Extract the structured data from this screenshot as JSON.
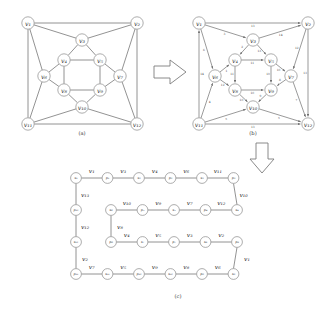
{
  "figure": {
    "panels": [
      {
        "id": "a",
        "caption": "(a)"
      },
      {
        "id": "b",
        "caption": "(b)"
      },
      {
        "id": "c",
        "caption": "(c)"
      }
    ],
    "arrows": [
      {
        "name": "arrow-right",
        "direction": "right"
      },
      {
        "name": "arrow-down",
        "direction": "down"
      }
    ]
  },
  "chart_data": {
    "type": "diagram",
    "title": "",
    "panel_a": {
      "caption": "(a)",
      "description": "undirected graph",
      "nodes": [
        {
          "id": "v1",
          "label": "v₁",
          "x": 28,
          "y": 23
        },
        {
          "id": "v2",
          "label": "v₂",
          "x": 137,
          "y": 23
        },
        {
          "id": "v3",
          "label": "v₃",
          "x": 82,
          "y": 40
        },
        {
          "id": "v4",
          "label": "v₄",
          "x": 64,
          "y": 60
        },
        {
          "id": "v5",
          "label": "v₅",
          "x": 100,
          "y": 60
        },
        {
          "id": "v6",
          "label": "v₆",
          "x": 44,
          "y": 76
        },
        {
          "id": "v7",
          "label": "v₇",
          "x": 120,
          "y": 76
        },
        {
          "id": "v8",
          "label": "v₈",
          "x": 64,
          "y": 90
        },
        {
          "id": "v9",
          "label": "v₉",
          "x": 100,
          "y": 90
        },
        {
          "id": "v10",
          "label": "v₁₀",
          "x": 82,
          "y": 107
        },
        {
          "id": "v11",
          "label": "v₁₁",
          "x": 28,
          "y": 124
        },
        {
          "id": "v12",
          "label": "v₁₂",
          "x": 137,
          "y": 124
        }
      ],
      "edges": [
        [
          "v1",
          "v2"
        ],
        [
          "v1",
          "v3"
        ],
        [
          "v1",
          "v6"
        ],
        [
          "v1",
          "v11"
        ],
        [
          "v2",
          "v3"
        ],
        [
          "v2",
          "v7"
        ],
        [
          "v2",
          "v12"
        ],
        [
          "v3",
          "v4"
        ],
        [
          "v3",
          "v5"
        ],
        [
          "v4",
          "v5"
        ],
        [
          "v4",
          "v6"
        ],
        [
          "v4",
          "v8"
        ],
        [
          "v5",
          "v7"
        ],
        [
          "v5",
          "v9"
        ],
        [
          "v6",
          "v8"
        ],
        [
          "v6",
          "v11"
        ],
        [
          "v7",
          "v9"
        ],
        [
          "v7",
          "v12"
        ],
        [
          "v8",
          "v9"
        ],
        [
          "v8",
          "v10"
        ],
        [
          "v9",
          "v10"
        ],
        [
          "v10",
          "v11"
        ],
        [
          "v10",
          "v12"
        ],
        [
          "v11",
          "v12"
        ]
      ]
    },
    "panel_b": {
      "caption": "(b)",
      "description": "directed graph with numbered edges",
      "nodes": [
        {
          "id": "v1",
          "label": "v₁",
          "x": 199,
          "y": 23
        },
        {
          "id": "v2",
          "label": "v₂",
          "x": 308,
          "y": 23
        },
        {
          "id": "v3",
          "label": "v₃",
          "x": 253,
          "y": 40
        },
        {
          "id": "v4",
          "label": "v₄",
          "x": 235,
          "y": 60
        },
        {
          "id": "v5",
          "label": "v₅",
          "x": 271,
          "y": 60
        },
        {
          "id": "v6",
          "label": "v₆",
          "x": 215,
          "y": 76
        },
        {
          "id": "v7",
          "label": "v₇",
          "x": 291,
          "y": 76
        },
        {
          "id": "v8",
          "label": "v₈",
          "x": 235,
          "y": 90
        },
        {
          "id": "v9",
          "label": "v₉",
          "x": 271,
          "y": 90
        },
        {
          "id": "v10",
          "label": "v₁₀",
          "x": 253,
          "y": 107
        },
        {
          "id": "v11",
          "label": "v₁₁",
          "x": 199,
          "y": 124
        },
        {
          "id": "v12",
          "label": "v₁₂",
          "x": 308,
          "y": 124
        }
      ],
      "edges": [
        {
          "from": "v1",
          "to": "v2",
          "weight": "13"
        },
        {
          "from": "v1",
          "to": "v3",
          "weight": "3"
        },
        {
          "from": "v1",
          "to": "v6",
          "weight": "6"
        },
        {
          "from": "v11",
          "to": "v1",
          "weight": "14"
        },
        {
          "from": "v3",
          "to": "v2",
          "weight": "14"
        },
        {
          "from": "v2",
          "to": "v7",
          "weight": "12"
        },
        {
          "from": "v2",
          "to": "v12",
          "weight": "13"
        },
        {
          "from": "v3",
          "to": "v4",
          "weight": "2"
        },
        {
          "from": "v3",
          "to": "v5",
          "weight": "13"
        },
        {
          "from": "v4",
          "to": "v5",
          "weight": "11"
        },
        {
          "from": "v6",
          "to": "v4",
          "weight": "1"
        },
        {
          "from": "v4",
          "to": "v8",
          "weight": "11"
        },
        {
          "from": "v5",
          "to": "v7",
          "weight": "10"
        },
        {
          "from": "v5",
          "to": "v9",
          "weight": "10"
        },
        {
          "from": "v6",
          "to": "v8",
          "weight": "12"
        },
        {
          "from": "v11",
          "to": "v6",
          "weight": "4"
        },
        {
          "from": "v7",
          "to": "v9",
          "weight": "8"
        },
        {
          "from": "v7",
          "to": "v12",
          "weight": "7"
        },
        {
          "from": "v8",
          "to": "v9",
          "weight": "10"
        },
        {
          "from": "v8",
          "to": "v10",
          "weight": "10"
        },
        {
          "from": "v9",
          "to": "v10",
          "weight": "9"
        },
        {
          "from": "v11",
          "to": "v10",
          "weight": "5"
        },
        {
          "from": "v10",
          "to": "v12",
          "weight": "5"
        },
        {
          "from": "v11",
          "to": "v12",
          "weight": "13"
        }
      ]
    },
    "panel_c": {
      "caption": "(c)",
      "description": "linearized serpentine path layout",
      "rows": [
        {
          "row": 1,
          "nodes": [
            "s₁",
            "p₁",
            "s₂",
            "p₂",
            "s₃",
            "p₃"
          ],
          "edge_labels": [
            "v₁",
            "v₃",
            "v₄",
            "v₆",
            "v₁₁"
          ]
        },
        {
          "row": 2,
          "nodes": [
            "s₆",
            "p₅",
            "s₅",
            "p₄",
            "s₄"
          ],
          "edge_labels": [
            "v₁₀",
            "v₉",
            "v₇",
            "v₁₂"
          ]
        },
        {
          "row": 3,
          "nodes": [
            "p₆",
            "s₇",
            "p₇",
            "s₈",
            "p₈"
          ],
          "edge_labels": [
            "v₄",
            "v₅",
            "v₃",
            "v₂"
          ]
        },
        {
          "row": 4,
          "nodes": [
            "p₁₁",
            "s₁₁",
            "p₁₀",
            "s₁₀",
            "p₉",
            "s₉"
          ],
          "edge_labels": [
            "v₇",
            "v₅",
            "v₉",
            "v₈",
            "v₆"
          ]
        }
      ],
      "left_column_nodes": [
        "s₁",
        "p₁₂",
        "s₁₂",
        "p₁₁"
      ],
      "left_column_labels": [
        "v₁₃",
        "v₁₂",
        "v₂"
      ],
      "right_connector_labels": [
        "v₁₀",
        "v₁"
      ],
      "middle_connector_label": "v₈"
    }
  }
}
